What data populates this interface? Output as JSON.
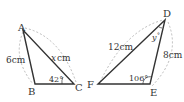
{
  "figure": {
    "triangle_abc": {
      "vertices": {
        "A": "A",
        "B": "B",
        "C": "C"
      },
      "side_ab": "6cm",
      "side_ac_var": "x",
      "side_ac_unit": "cm",
      "angle_c": "42°"
    },
    "triangle_def": {
      "vertices": {
        "D": "D",
        "E": "E",
        "F": "F"
      },
      "side_df": "12cm",
      "side_de": "8cm",
      "angle_d_var": "y",
      "angle_d_unit": "°",
      "angle_e": "106°"
    },
    "colors": {
      "stroke": "#333333",
      "dashed": "#999999"
    }
  }
}
